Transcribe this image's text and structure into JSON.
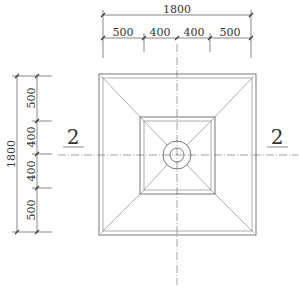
{
  "drawing": {
    "type": "plan view",
    "top_dimensions": {
      "overall": "1800",
      "segments": [
        "500",
        "400",
        "400",
        "500"
      ]
    },
    "left_dimensions": {
      "overall": "1800",
      "segments": [
        "500",
        "400",
        "400",
        "500"
      ]
    },
    "section_markers": {
      "left": "2",
      "right": "2"
    }
  }
}
